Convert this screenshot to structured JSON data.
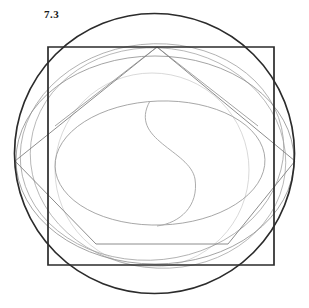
{
  "figure": {
    "caption": "7.3",
    "canvas": {
      "width": 309,
      "height": 308,
      "background": "#ffffff"
    },
    "palette": {
      "heavy_dark": "#2b2b2b",
      "medium_gray": "#7a7a7a",
      "light_gray": "#9a9a9a",
      "faint_gray": "#b4b4b4",
      "very_faint_gray": "#c4c4c4"
    },
    "shapes": {
      "outer_circle": {
        "name": "outer-circle",
        "cx": 154.5,
        "cy": 153.5,
        "r": 140,
        "stroke": "#2b2b2b",
        "stroke_width": 1.7
      },
      "square": {
        "name": "bounding-square",
        "x": 48,
        "y": 47,
        "width": 226,
        "height": 218,
        "stroke": "#2b2b2b",
        "stroke_width": 1.7
      },
      "pentagon": {
        "name": "inscribed-pentagon",
        "points": "157,47 295,161 228,244 96,244 15,161",
        "stroke": "#7a7a7a",
        "stroke_width": 0.9
      },
      "wide_ellipse_upper": {
        "name": "wide-ellipse-upper",
        "cx": 155,
        "cy": 160,
        "rx": 140,
        "ry": 104,
        "rotate": 0,
        "stroke": "#8a8a8a",
        "stroke_width": 0.8
      },
      "tilted_ellipse_a": {
        "name": "tilted-ellipse-a",
        "cx": 152,
        "cy": 152,
        "rx": 132,
        "ry": 108,
        "rotate": -6,
        "stroke": "#9a9a9a",
        "stroke_width": 0.8
      },
      "tilted_ellipse_b": {
        "name": "tilted-ellipse-b",
        "cx": 158,
        "cy": 158,
        "rx": 128,
        "ry": 110,
        "rotate": 7,
        "stroke": "#a2a2a2",
        "stroke_width": 0.8
      },
      "inner_ellipse": {
        "name": "inner-ellipse",
        "cx": 160,
        "cy": 163,
        "rx": 105,
        "ry": 62,
        "rotate": -2,
        "stroke": "#8f8f8f",
        "stroke_width": 0.8
      },
      "faint_circle": {
        "name": "faint-inner-circle",
        "cx": 152,
        "cy": 170,
        "r": 97,
        "stroke": "#c4c4c4",
        "stroke_width": 0.7
      },
      "s_curve": {
        "name": "s-curve",
        "path": "M 150 101 C 128 138 190 148 195 178 C 199 205 180 222 158 225",
        "stroke": "#a8a8a8",
        "stroke_width": 1.0
      },
      "pentagon_spokes": {
        "name": "pentagon-spokes",
        "segments": [
          {
            "x1": 157,
            "y1": 47,
            "x2": 55,
            "y2": 125
          },
          {
            "x1": 157,
            "y1": 47,
            "x2": 258,
            "y2": 125
          }
        ],
        "stroke": "#8a8a8a",
        "stroke_width": 0.8
      }
    }
  }
}
